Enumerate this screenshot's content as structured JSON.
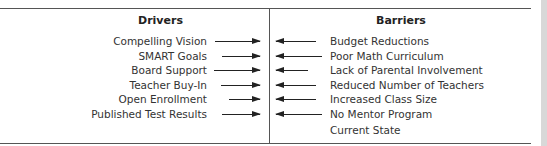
{
  "headings": {
    "drivers": "Drivers",
    "barriers": "Barriers"
  },
  "drivers": [
    {
      "label": "Compelling Vision"
    },
    {
      "label": "SMART Goals"
    },
    {
      "label": "Board Support"
    },
    {
      "label": "Teacher Buy-In"
    },
    {
      "label": "Open Enrollment"
    },
    {
      "label": "Published Test Results"
    }
  ],
  "barriers": [
    {
      "label": "Budget Reductions"
    },
    {
      "label": "Poor Math Curriculum"
    },
    {
      "label": "Lack of Parental Involvement"
    },
    {
      "label": "Reduced Number of Teachers"
    },
    {
      "label": "Increased Class Size"
    },
    {
      "label": "No Mentor Program"
    }
  ],
  "footer_label": "Current State"
}
